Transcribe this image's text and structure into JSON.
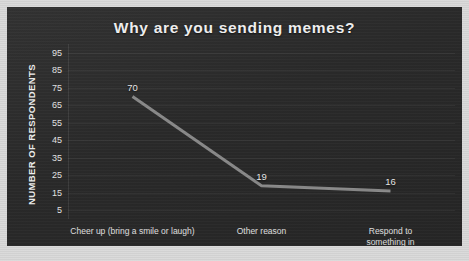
{
  "chart_data": {
    "type": "line",
    "title": "Why are you sending memes?",
    "xlabel": "",
    "ylabel": "NUMBER OF RESPONDENTS",
    "categories": [
      "Cheer up (bring a smile or laugh)",
      "Other reason",
      "Respond to something in\nconversation (replace words)"
    ],
    "values": [
      70,
      19,
      16
    ],
    "point_labels": [
      "70",
      "19",
      "16"
    ],
    "yticks": [
      5,
      15,
      25,
      35,
      45,
      55,
      65,
      75,
      85,
      95
    ],
    "ytick_labels": [
      "5",
      "15",
      "25",
      "35",
      "45",
      "55",
      "65",
      "75",
      "85",
      "95"
    ],
    "ylim": [
      0,
      100
    ],
    "grid": true,
    "legend": false,
    "series": [
      {
        "name": "Number of respondents",
        "values": [
          70,
          19,
          16
        ]
      }
    ]
  },
  "style": {
    "panel_background": "#2c2c2c",
    "outer_background": "#d6d6d6",
    "title_color": "#f2f2f2",
    "text_color": "#e6e6e6",
    "line_color": "#8a8a8a",
    "gridline_color": "#3d3d3d"
  }
}
